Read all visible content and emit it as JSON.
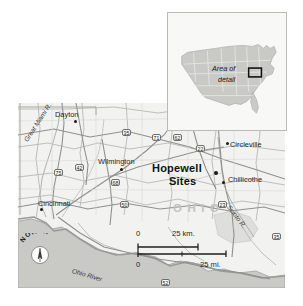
{
  "figure": {
    "state_label": "OHIO",
    "background_color": "#ffffff",
    "map_fill_color": "#f2f2f1",
    "shaded_region_color": "#c9c9c6",
    "road_color": "#b5b5b2",
    "text_color": "#262626"
  },
  "inset": {
    "name": "united-states-locator",
    "label_line1": "Area of",
    "label_line2": "detail",
    "country": "United States",
    "landmass_color": "#c9c9c6",
    "border_color": "#b9b9b7"
  },
  "main_map": {
    "places": [
      {
        "name": "Dayton",
        "label": "Dayton",
        "x": 62,
        "y": 112,
        "dot_x": 74,
        "dot_y": 120,
        "size": "normal"
      },
      {
        "name": "Wilmington",
        "label": "Wilmington",
        "x": 100,
        "y": 158,
        "dot_x": 120,
        "dot_y": 168,
        "size": "normal"
      },
      {
        "name": "Cincinnati",
        "label": "Cincinnati",
        "x": 38,
        "y": 200,
        "dot_x": 40,
        "dot_y": 208,
        "size": "normal"
      },
      {
        "name": "Circleville",
        "label": "Circleville",
        "x": 231,
        "y": 144,
        "dot_x": 226,
        "dot_y": 142,
        "size": "normal"
      },
      {
        "name": "Chillicothe",
        "label": "Chillicothe",
        "x": 228,
        "y": 177,
        "dot_x": 222,
        "dot_y": 181,
        "size": "normal"
      },
      {
        "name": "Hopewell Sites",
        "label": "Hopewell\nSites",
        "x": 155,
        "y": 165,
        "dot_x": 214,
        "dot_y": 172,
        "size": "big"
      }
    ],
    "hopewell_line1": "Hopewell",
    "hopewell_line2": "Sites",
    "rivers": [
      {
        "name": "great-miami-river",
        "label": "Great Miami R.",
        "x": 30,
        "y": 130,
        "rotate": -58
      },
      {
        "name": "scioto-river",
        "label": "Scioto R.",
        "x": 230,
        "y": 205,
        "rotate": 52
      },
      {
        "name": "ohio-river",
        "label": "Ohio River",
        "x": 72,
        "y": 273,
        "rotate": 17
      }
    ],
    "highway_shields": [
      {
        "number": "35",
        "x": 126,
        "y": 129
      },
      {
        "number": "71",
        "x": 156,
        "y": 134
      },
      {
        "number": "62",
        "x": 176,
        "y": 134
      },
      {
        "number": "22",
        "x": 198,
        "y": 145
      },
      {
        "number": "75",
        "x": 56,
        "y": 168
      },
      {
        "number": "42",
        "x": 76,
        "y": 163
      },
      {
        "number": "68",
        "x": 113,
        "y": 178
      },
      {
        "number": "50",
        "x": 122,
        "y": 201
      },
      {
        "number": "23",
        "x": 220,
        "y": 201
      },
      {
        "number": "35",
        "x": 274,
        "y": 233
      },
      {
        "number": "52",
        "x": 163,
        "y": 279
      }
    ]
  },
  "compass": {
    "label": "NORTH",
    "direction": "north",
    "letters": [
      "N",
      "O",
      "R",
      "T",
      "H"
    ]
  },
  "scale_bar": {
    "km_zero": "0",
    "km_max": "25 km.",
    "mi_zero": "0",
    "mi_max": "25 mi.",
    "km_units": "km.",
    "mi_units": "mi.",
    "km_value": 25,
    "mi_value": 25
  }
}
